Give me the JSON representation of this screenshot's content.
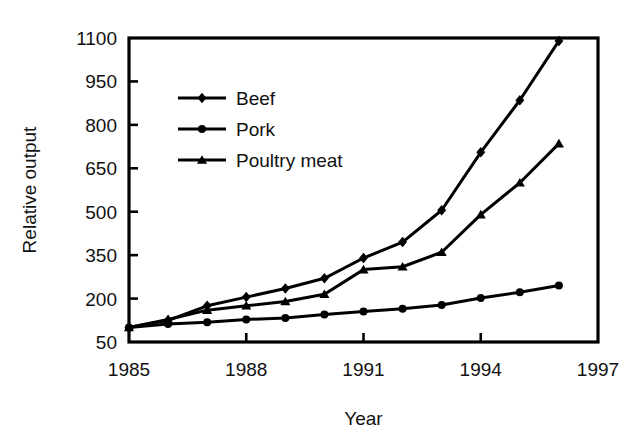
{
  "chart_data": {
    "type": "line",
    "title": "",
    "xlabel": "Year",
    "ylabel": "Relative output",
    "x": [
      1985,
      1986,
      1987,
      1988,
      1989,
      1990,
      1991,
      1992,
      1993,
      1994,
      1995,
      1996
    ],
    "xlim": [
      1985,
      1997
    ],
    "ylim": [
      50,
      1100
    ],
    "xticks": [
      1985,
      1988,
      1991,
      1994,
      1997
    ],
    "xtick_labels": [
      "1985",
      "1988",
      "1991",
      "1994",
      "1997"
    ],
    "yticks": [
      50,
      200,
      350,
      500,
      650,
      800,
      950,
      1100
    ],
    "ytick_labels": [
      "50",
      "200",
      "350",
      "500",
      "650",
      "800",
      "950",
      "1100"
    ],
    "grid": false,
    "legend_position": "upper-left-inside",
    "series": [
      {
        "name": "Beef",
        "marker": "diamond",
        "color": "#000000",
        "values": [
          100,
          125,
          175,
          205,
          235,
          270,
          340,
          395,
          505,
          705,
          885,
          1090
        ]
      },
      {
        "name": "Pork",
        "marker": "circle",
        "color": "#000000",
        "values": [
          100,
          112,
          118,
          128,
          133,
          145,
          155,
          165,
          178,
          202,
          222,
          245
        ]
      },
      {
        "name": "Poultry meat",
        "marker": "triangle",
        "color": "#000000",
        "values": [
          100,
          128,
          160,
          175,
          190,
          215,
          300,
          310,
          360,
          490,
          600,
          735
        ]
      }
    ]
  },
  "axes": {
    "x_axis_label": "Year",
    "y_axis_label": "Relative output"
  },
  "legend": {
    "items": [
      {
        "label": "Beef",
        "marker": "diamond"
      },
      {
        "label": "Pork",
        "marker": "circle"
      },
      {
        "label": "Poultry meat",
        "marker": "triangle"
      }
    ]
  },
  "style": {
    "line_color": "#000000",
    "axis_color": "#000000",
    "background": "#ffffff"
  }
}
